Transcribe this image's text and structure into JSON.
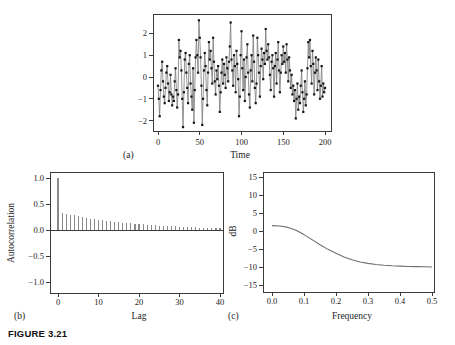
{
  "figure": {
    "caption": "FIGURE 3.21"
  },
  "colors": {
    "axis": "#3a3a3a",
    "series_line": "#7a7a7a",
    "marker": "#141414",
    "stem": "#8a8a8a",
    "spectrum_line": "#6f6f6f",
    "text": "#1c1c1c"
  },
  "chart_data": [
    {
      "id": "a",
      "tag": "(a)",
      "type": "line",
      "xlabel": "Time",
      "ylabel": "",
      "legend": "none",
      "grid": false,
      "xlim": [
        -6,
        207
      ],
      "ylim": [
        -2.5,
        2.9
      ],
      "x_ticks": {
        "values": [
          0,
          50,
          100,
          150,
          200
        ],
        "labels": [
          "0",
          "50",
          "100",
          "150",
          "200"
        ]
      },
      "y_ticks": {
        "values": [
          -2,
          -1,
          0,
          1,
          2
        ],
        "labels": [
          "−2",
          "−1",
          "0",
          "1",
          "2"
        ]
      },
      "x_start": 0,
      "x_step": 1,
      "marker": "square",
      "values": [
        -0.4,
        -1.0,
        -1.8,
        -0.6,
        0.3,
        0.7,
        -0.2,
        -0.9,
        -1.2,
        -0.5,
        0.2,
        0.5,
        -0.3,
        -1.1,
        -0.7,
        0.1,
        -0.8,
        -1.3,
        -0.9,
        -1.1,
        -0.2,
        0.4,
        -0.6,
        -1.4,
        -0.8,
        1.7,
        0.9,
        1.2,
        0.3,
        -1.0,
        -2.3,
        -0.7,
        0.8,
        1.1,
        0.2,
        -0.5,
        -1.2,
        0.6,
        1.0,
        -0.3,
        -0.9,
        -1.5,
        0.4,
        -2.1,
        -0.6,
        0.9,
        1.7,
        1.0,
        0.2,
        2.6,
        1.8,
        0.9,
        -0.4,
        -2.2,
        -1.0,
        0.3,
        1.1,
        0.5,
        -0.6,
        -1.3,
        0.2,
        1.6,
        0.8,
        1.2,
        0.4,
        -0.3,
        1.8,
        0.7,
        -0.2,
        -0.8,
        0.3,
        -0.1,
        0.5,
        -0.4,
        -1.6,
        -0.7,
        0.2,
        0.8,
        -0.3,
        0.6,
        0.1,
        -0.5,
        0.9,
        0.4,
        -0.2,
        0.7,
        1.4,
        2.5,
        0.8,
        0.3,
        -0.4,
        1.0,
        0.5,
        -0.7,
        1.2,
        0.6,
        -0.1,
        -1.8,
        -0.9,
        1.0,
        2.1,
        0.4,
        -0.6,
        0.8,
        -1.1,
        0.0,
        0.9,
        1.5,
        0.2,
        -0.8,
        -1.4,
        0.3,
        1.0,
        -0.2,
        1.9,
        0.7,
        -0.5,
        -1.2,
        -0.3,
        1.8,
        1.0,
        0.2,
        -0.9,
        0.5,
        1.3,
        0.8,
        -0.1,
        1.1,
        0.6,
        2.2,
        1.2,
        0.8,
        1.5,
        0.9,
        0.1,
        -0.6,
        0.7,
        1.0,
        0.4,
        -0.9,
        0.5,
        1.1,
        -0.3,
        0.8,
        1.6,
        0.3,
        -0.7,
        0.2,
        1.0,
        0.6,
        1.4,
        0.7,
        1.1,
        0.2,
        1.5,
        0.8,
        -0.2,
        0.9,
        0.3,
        -0.5,
        0.1,
        -0.8,
        -0.4,
        -1.1,
        -0.6,
        -1.9,
        -1.0,
        -0.3,
        -1.5,
        -0.9,
        -1.2,
        -0.4,
        0.3,
        -0.7,
        -1.6,
        -1.0,
        -0.2,
        -1.3,
        -0.8,
        0.4,
        1.6,
        0.9,
        1.7,
        0.5,
        -0.3,
        1.2,
        0.6,
        -0.8,
        0.2,
        0.9,
        0.3,
        -0.6,
        0.8,
        -0.2,
        -1.0,
        -0.4,
        0.5,
        -0.9,
        -0.3,
        -0.7,
        -0.5
      ]
    },
    {
      "id": "b",
      "tag": "(b)",
      "type": "bar",
      "xlabel": "Lag",
      "ylabel": "Autocorrelation",
      "legend": "none",
      "grid": false,
      "xlim": [
        -2,
        41
      ],
      "ylim": [
        -1.21,
        1.12
      ],
      "x_ticks": {
        "values": [
          0,
          10,
          20,
          30,
          40
        ],
        "labels": [
          "0",
          "10",
          "20",
          "30",
          "40"
        ]
      },
      "y_ticks": {
        "values": [
          -1.0,
          -0.5,
          0.0,
          0.5,
          1.0
        ],
        "labels": [
          "−1.0",
          "−0.5",
          "0.0",
          "0.5",
          "1.0"
        ]
      },
      "x_start": 0,
      "x_step": 1,
      "zero_line": true,
      "values": [
        1.0,
        0.33,
        0.31,
        0.295,
        0.28,
        0.265,
        0.25,
        0.235,
        0.22,
        0.21,
        0.2,
        0.19,
        0.18,
        0.17,
        0.16,
        0.152,
        0.144,
        0.136,
        0.128,
        0.121,
        0.114,
        0.108,
        0.102,
        0.096,
        0.091,
        0.086,
        0.081,
        0.077,
        0.072,
        0.068,
        0.064,
        0.061,
        0.057,
        0.054,
        0.051,
        0.048,
        0.045,
        0.043,
        0.04,
        0.038,
        0.036
      ]
    },
    {
      "id": "c",
      "tag": "(c)",
      "type": "line",
      "xlabel": "Frequency",
      "ylabel": "dB",
      "legend": "none",
      "grid": false,
      "xlim": [
        -0.028,
        0.506
      ],
      "ylim": [
        -16.9,
        16.4
      ],
      "x_ticks": {
        "values": [
          0.0,
          0.1,
          0.2,
          0.3,
          0.4,
          0.5
        ],
        "labels": [
          "0.0",
          "0.1",
          "0.2",
          "0.3",
          "0.4",
          "0.5"
        ]
      },
      "y_ticks": {
        "values": [
          -15,
          -10,
          -5,
          0,
          5,
          10,
          15
        ],
        "labels": [
          "−15",
          "−10",
          "−5",
          "0",
          "5",
          "10",
          "15"
        ]
      },
      "x": [
        0,
        0.025,
        0.05,
        0.075,
        0.1,
        0.125,
        0.15,
        0.175,
        0.2,
        0.225,
        0.25,
        0.275,
        0.3,
        0.325,
        0.35,
        0.375,
        0.4,
        0.425,
        0.45,
        0.475,
        0.5
      ],
      "values": [
        1.5,
        1.4,
        1.0,
        0.2,
        -1.0,
        -2.4,
        -3.8,
        -5.1,
        -6.2,
        -7.2,
        -8.0,
        -8.6,
        -9.0,
        -9.3,
        -9.5,
        -9.65,
        -9.75,
        -9.85,
        -9.9,
        -9.95,
        -10.0
      ]
    }
  ]
}
